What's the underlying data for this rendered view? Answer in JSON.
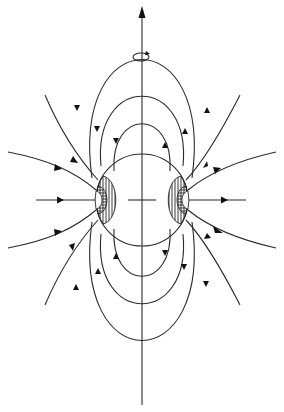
{
  "diagram": {
    "type": "magnetic-field-lines-around-rotating-sphere",
    "axis": {
      "label": "",
      "arrow": "up",
      "rotation_symbol": "circular-arrow"
    },
    "sphere": {
      "cx": 142,
      "cy": 200,
      "r": 46
    },
    "colors": {
      "line": "#2a2a2a",
      "background": "#ffffff",
      "hatch": "#222222"
    },
    "labels": []
  }
}
